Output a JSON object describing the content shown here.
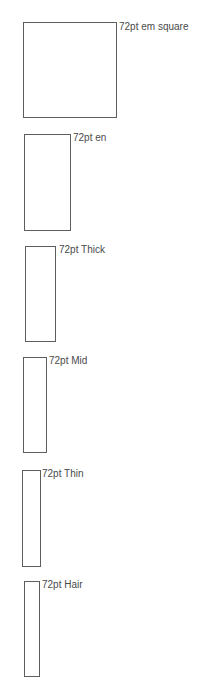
{
  "diagram": {
    "line_color": "#5e5e5e",
    "text_color": "#4a4a4a",
    "specimens": [
      {
        "label": "72pt em square",
        "box": {
          "x": 23,
          "y": 22,
          "w": 94,
          "h": 96
        },
        "label_pos": {
          "x": 119,
          "y": 21
        }
      },
      {
        "label": "72pt en",
        "box": {
          "x": 24,
          "y": 134,
          "w": 47,
          "h": 97
        },
        "label_pos": {
          "x": 73,
          "y": 132
        }
      },
      {
        "label": "72pt Thick",
        "box": {
          "x": 25,
          "y": 246,
          "w": 31,
          "h": 96
        },
        "label_pos": {
          "x": 59,
          "y": 244
        }
      },
      {
        "label": "72pt Mid",
        "box": {
          "x": 23,
          "y": 357,
          "w": 24,
          "h": 96
        },
        "label_pos": {
          "x": 49,
          "y": 355
        }
      },
      {
        "label": "72pt Thin",
        "box": {
          "x": 22,
          "y": 470,
          "w": 19,
          "h": 97
        },
        "label_pos": {
          "x": 42,
          "y": 468
        }
      },
      {
        "label": "72pt Hair",
        "box": {
          "x": 24,
          "y": 581,
          "w": 16,
          "h": 96
        },
        "label_pos": {
          "x": 42,
          "y": 579
        }
      }
    ]
  }
}
